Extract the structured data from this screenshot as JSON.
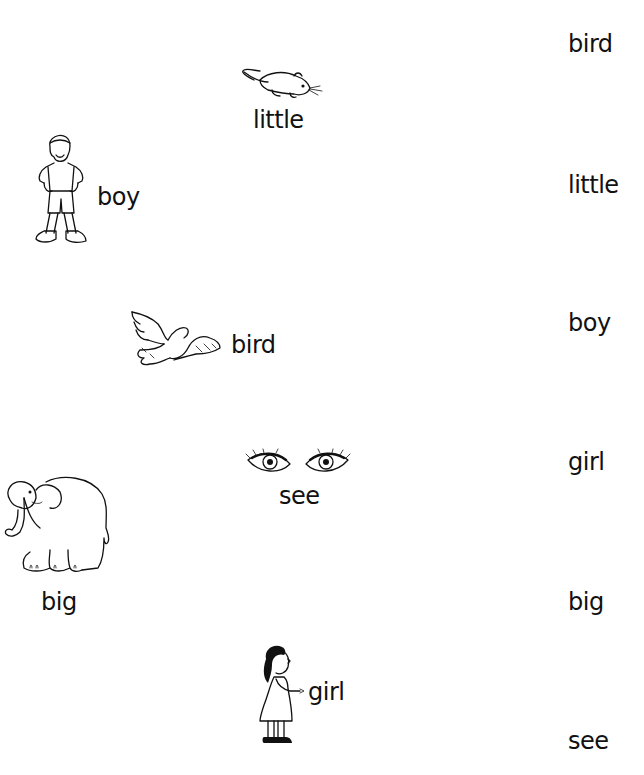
{
  "worksheet": {
    "left_items": [
      {
        "id": "mouse",
        "icon": "mouse-icon",
        "word": "little"
      },
      {
        "id": "boy",
        "icon": "boy-icon",
        "word": "boy"
      },
      {
        "id": "bird",
        "icon": "bird-icon",
        "word": "bird"
      },
      {
        "id": "eyes",
        "icon": "eyes-icon",
        "word": "see"
      },
      {
        "id": "elephant",
        "icon": "elephant-icon",
        "word": "big"
      },
      {
        "id": "girl",
        "icon": "girl-icon",
        "word": "girl"
      }
    ],
    "right_words": [
      "bird",
      "little",
      "boy",
      "girl",
      "big",
      "see"
    ]
  }
}
